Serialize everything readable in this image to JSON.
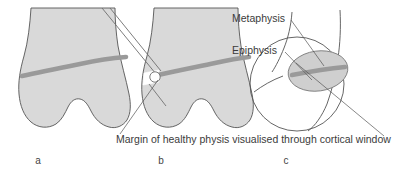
{
  "figure": {
    "background_color": "#ffffff",
    "colors": {
      "bone_fill": "#d9d9d9",
      "bone_outline": "#555555",
      "physis_band": "#9a9a9a",
      "instrument_stroke": "#6e6e6e",
      "leader_line": "#555555",
      "text": "#3b3b3b",
      "window_fill": "#ffffff",
      "inset_fill": "#cfcfcf"
    },
    "panels": [
      {
        "id": "a",
        "letter": "a",
        "description": "Distal femur with intact physis (growth plate) shown as darker band across metaphysis"
      },
      {
        "id": "b",
        "letter": "b",
        "description": "Arthroscope probe directed into a cortical window cut at the physis margin"
      },
      {
        "id": "c",
        "letter": "c",
        "description": "Magnified circular inset of the cortical window showing epiphysis and metaphysis"
      }
    ],
    "annotations": [
      {
        "id": "metaphysis",
        "text": "Metaphysis",
        "x": 232,
        "y": 22,
        "panel": "c"
      },
      {
        "id": "epiphysis",
        "text": "Epiphysis",
        "x": 232,
        "y": 54,
        "panel": "c"
      }
    ],
    "caption": {
      "id": "cortical-window-caption",
      "text": "Margin of healthy physis visualised through cortical window",
      "x": 116,
      "y": 143
    }
  }
}
